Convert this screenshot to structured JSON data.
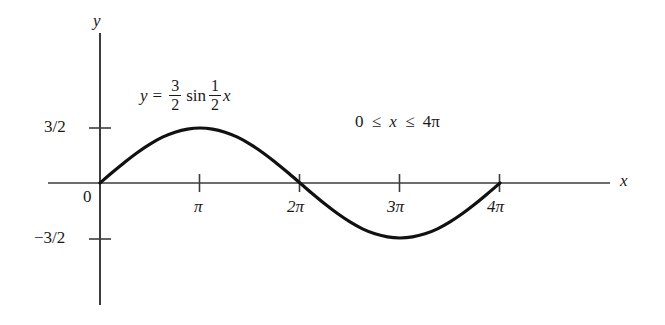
{
  "figure": {
    "background_color": "#ffffff",
    "ink_color": "#1a1a1a",
    "axis_labels": {
      "x": "x",
      "y": "y"
    },
    "origin_label": "0",
    "equation": {
      "lhs": "y",
      "equals": "=",
      "amplitude_numerator": "3",
      "amplitude_denominator": "2",
      "function": "sin",
      "frequency_numerator": "1",
      "frequency_denominator": "2",
      "variable": "x",
      "plain": "y = 3/2 sin 1/2 x"
    },
    "domain_note": {
      "lower": "0",
      "rel1": "≤",
      "variable": "x",
      "rel2": "≤",
      "upper": "4π",
      "plain": "0 ≤ x ≤ 4π"
    },
    "y_ticks": [
      {
        "label": "3/2",
        "value": 1.5
      },
      {
        "label": "−3/2",
        "value": -1.5
      }
    ],
    "x_ticks": [
      {
        "label": "π",
        "value": 3.14159
      },
      {
        "label": "2π",
        "value": 6.28319
      },
      {
        "label": "3π",
        "value": 9.42478
      },
      {
        "label": "4π",
        "value": 12.56637
      }
    ]
  },
  "chart_data": {
    "type": "line",
    "title": "",
    "subtitle": "",
    "xlabel": "x",
    "ylabel": "y",
    "xlim": [
      -0.52,
      5.1
    ],
    "ylim": [
      -2.7,
      2.7
    ],
    "grid": false,
    "legend": null,
    "annotations": [
      {
        "text": "y = 3/2 sin 1/2 x",
        "x_pi": 0.55,
        "y": 2.0
      },
      {
        "text": "0 ≤ x ≤ 4π",
        "x_pi": 2.55,
        "y": 1.62
      }
    ],
    "x_tick_labels": [
      "π",
      "2π",
      "3π",
      "4π"
    ],
    "x_tick_values_pi": [
      1,
      2,
      3,
      4
    ],
    "y_tick_labels": [
      "3/2",
      "−3/2"
    ],
    "y_tick_values": [
      1.5,
      -1.5
    ],
    "series": [
      {
        "name": "y = 3/2 sin(x/2)",
        "equation": "y = 1.5*sin(0.5*x)",
        "amplitude": 1.5,
        "period_pi": 4,
        "domain_pi": [
          0,
          4
        ],
        "color": "#111111",
        "linewidth": 3.2,
        "x_pi": [
          0,
          0.125,
          0.25,
          0.375,
          0.5,
          0.625,
          0.75,
          0.875,
          1,
          1.125,
          1.25,
          1.375,
          1.5,
          1.625,
          1.75,
          1.875,
          2,
          2.125,
          2.25,
          2.375,
          2.5,
          2.625,
          2.75,
          2.875,
          3,
          3.125,
          3.25,
          3.375,
          3.5,
          3.625,
          3.75,
          3.875,
          4
        ],
        "values": [
          0,
          0.293,
          0.574,
          0.833,
          1.061,
          1.25,
          1.386,
          1.471,
          1.5,
          1.471,
          1.386,
          1.25,
          1.061,
          0.833,
          0.574,
          0.293,
          0,
          -0.293,
          -0.574,
          -0.833,
          -1.061,
          -1.25,
          -1.386,
          -1.471,
          -1.5,
          -1.471,
          -1.386,
          -1.25,
          -1.061,
          -0.833,
          -0.574,
          -0.293,
          0
        ]
      }
    ]
  }
}
